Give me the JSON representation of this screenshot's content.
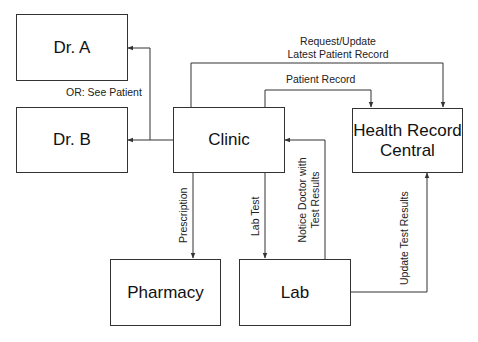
{
  "nodes": {
    "dr_a": "Dr. A",
    "dr_b": "Dr. B",
    "clinic": "Clinic",
    "health_record_central_line1": "Health Record",
    "health_record_central_line2": "Central",
    "pharmacy": "Pharmacy",
    "lab": "Lab"
  },
  "edges": {
    "see_patient": "OR: See Patient",
    "request_update_line1": "Request/Update",
    "request_update_line2": "Latest Patient Record",
    "patient_record": "Patient Record",
    "prescription": "Prescription",
    "lab_test": "Lab Test",
    "notice_doctor_line1": "Notice Doctor with",
    "notice_doctor_line2": "Test Results",
    "update_test_results": "Update Test Results"
  },
  "colors": {
    "line": "#333333",
    "background": "#ffffff"
  }
}
